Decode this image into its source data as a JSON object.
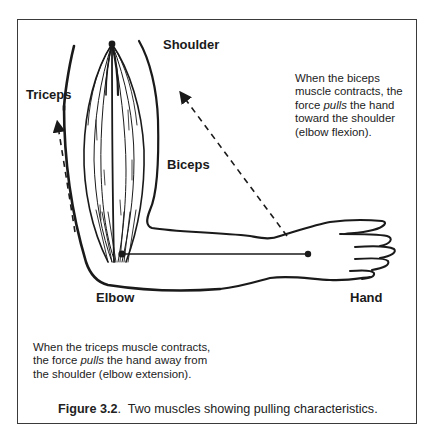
{
  "labels": {
    "shoulder": "Shoulder",
    "triceps": "Triceps",
    "biceps": "Biceps",
    "elbow": "Elbow",
    "hand": "Hand"
  },
  "notes": {
    "biceps": {
      "before": "When the biceps muscle contracts, the force ",
      "emphasis": "pulls",
      "after": " the hand toward the shoulder (elbow flexion)."
    },
    "triceps": {
      "before": "When the triceps muscle contracts, the force ",
      "emphasis": "pulls",
      "after": " the hand away from the shoulder (elbow extension)."
    }
  },
  "caption": {
    "figure_number": "Figure 3.2",
    "separator": ".",
    "text": "  Two muscles showing pulling characteristics."
  },
  "icons": {
    "biceps_arrow": "arrow-up-left-dashed",
    "triceps_arrow": "arrow-up-dashed"
  },
  "colors": {
    "ink": "#1a1a1a",
    "frame": "#3a3a3a",
    "background": "#ffffff"
  }
}
